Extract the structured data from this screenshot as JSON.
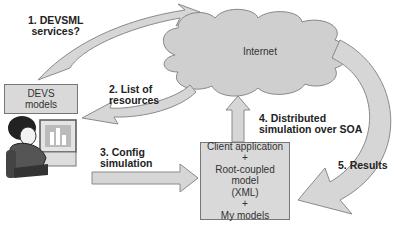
{
  "diagram": {
    "cloud": {
      "label": "Internet"
    },
    "devs_box": {
      "line1": "DEVS",
      "line2": "models"
    },
    "client_box": {
      "line1": "Client application",
      "plus1": "+",
      "line2": "Root-coupled model",
      "line3": "(XML)",
      "plus2": "+",
      "line4": "My models"
    },
    "steps": [
      {
        "line1": "1. DEVSML",
        "line2": "services?"
      },
      {
        "line1": "2. List of",
        "line2": "resources"
      },
      {
        "line1": "3. Config",
        "line2": "simulation"
      },
      {
        "line1": "4. Distributed",
        "line2": "simulation over SOA"
      },
      {
        "line1": "5. Results"
      }
    ],
    "colors": {
      "arrow_fill": "#d6d6d6",
      "arrow_stroke": "#8a8a8a",
      "cloud_fill": "#cfcfcf",
      "box_fill": "#d9d9d9"
    }
  }
}
